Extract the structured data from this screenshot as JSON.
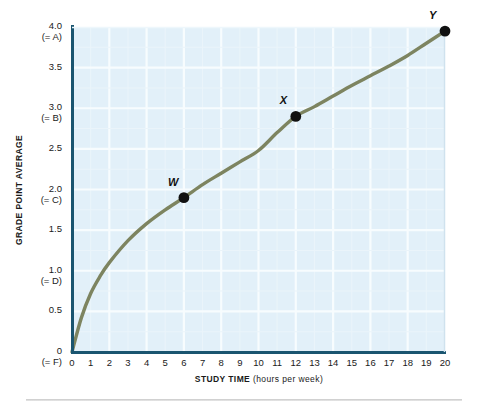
{
  "chart_data": {
    "type": "line",
    "title": "",
    "xlabel": "STUDY TIME (hours per week)",
    "xlabel_main": "STUDY TIME",
    "xlabel_paren": "(hours per week)",
    "ylabel": "GRADE POINT AVERAGE",
    "xlim": [
      0,
      20
    ],
    "ylim": [
      0,
      4.0
    ],
    "grid": true,
    "legend": "none",
    "xticks": [
      "0",
      "1",
      "2",
      "3",
      "4",
      "5",
      "6",
      "7",
      "8",
      "9",
      "10",
      "11",
      "12",
      "13",
      "14",
      "15",
      "16",
      "17",
      "18",
      "19",
      "20"
    ],
    "yticks": [
      {
        "value": 4.0,
        "label": "4.0",
        "sub": "(= A)"
      },
      {
        "value": 3.5,
        "label": "3.5",
        "sub": ""
      },
      {
        "value": 3.0,
        "label": "3.0",
        "sub": "(= B)"
      },
      {
        "value": 2.5,
        "label": "2.5",
        "sub": ""
      },
      {
        "value": 2.0,
        "label": "2.0",
        "sub": "(= C)"
      },
      {
        "value": 1.5,
        "label": "1.5",
        "sub": ""
      },
      {
        "value": 1.0,
        "label": "1.0",
        "sub": "(= D)"
      },
      {
        "value": 0.5,
        "label": "0.5",
        "sub": ""
      },
      {
        "value": 0.0,
        "label": "0",
        "sub": "(= F)"
      }
    ],
    "series": [
      {
        "name": "GPA vs study time",
        "x": [
          0,
          0.5,
          1,
          1.5,
          2,
          3,
          4,
          5,
          6,
          7,
          8,
          9,
          10,
          11,
          12,
          13,
          14,
          15,
          16,
          17,
          18,
          19,
          20
        ],
        "y": [
          0,
          0.42,
          0.72,
          0.93,
          1.1,
          1.37,
          1.58,
          1.75,
          1.9,
          2.06,
          2.2,
          2.34,
          2.48,
          2.7,
          2.9,
          3.02,
          3.15,
          3.28,
          3.4,
          3.52,
          3.65,
          3.8,
          3.95
        ]
      }
    ],
    "annotated_points": [
      {
        "label": "W",
        "x": 6,
        "y": 1.9
      },
      {
        "label": "X",
        "x": 12,
        "y": 2.9
      },
      {
        "label": "Y",
        "x": 20,
        "y": 3.95
      }
    ],
    "colors": {
      "plot_background": "#e2f0f9",
      "gridline": "#f4fafd",
      "axis": "#1a5570",
      "curve": "#7d8460",
      "point": "#111111",
      "text": "#1a1a1a",
      "rule": "#c9c9c9"
    }
  }
}
